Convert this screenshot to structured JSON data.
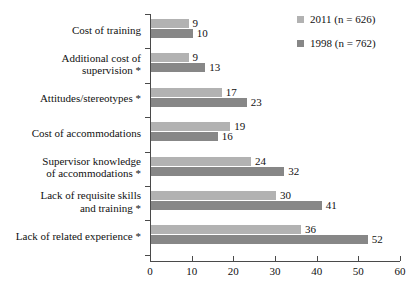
{
  "chart_data": {
    "type": "bar",
    "orientation": "horizontal",
    "title": "",
    "xlabel": "",
    "ylabel": "",
    "xlim": [
      0,
      60
    ],
    "xticks": [
      0,
      10,
      20,
      30,
      40,
      50,
      60
    ],
    "grid": false,
    "legend_position": "top-right",
    "categories": [
      "Cost of training",
      "Additional cost of supervision *",
      "Attitudes/stereotypes *",
      "Cost of accommodations",
      "Supervisor knowledge of accommodations *",
      "Lack of requisite skills and training *",
      "Lack of related experience *"
    ],
    "category_lines": [
      [
        "Cost of training"
      ],
      [
        "Additional cost of",
        "supervision *"
      ],
      [
        "Attitudes/stereotypes *"
      ],
      [
        "Cost of accommodations"
      ],
      [
        "Supervisor knowledge",
        "of accommodations *"
      ],
      [
        "Lack of requisite skills",
        "and training *"
      ],
      [
        "Lack of related experience *"
      ]
    ],
    "series": [
      {
        "name": "2011 (n = 626)",
        "color": "#b2b2b2",
        "values": [
          9,
          9,
          17,
          19,
          24,
          30,
          36
        ]
      },
      {
        "name": "1998 (n = 762)",
        "color": "#878787",
        "values": [
          10,
          13,
          23,
          16,
          32,
          41,
          52
        ]
      }
    ]
  },
  "legend": {
    "entries": [
      {
        "label": "2011 (n = 626)",
        "color": "#b2b2b2"
      },
      {
        "label": "1998 (n = 762)",
        "color": "#878787"
      }
    ]
  },
  "axis": {
    "tick_labels": [
      "0",
      "10",
      "20",
      "30",
      "40",
      "50",
      "60"
    ]
  }
}
